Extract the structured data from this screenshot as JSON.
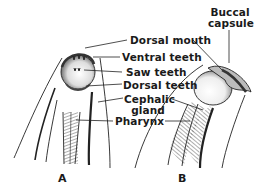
{
  "diagram": {
    "labels": {
      "dorsal_mouth": "Dorsal mouth",
      "ventral_teeth": "Ventral teeth",
      "saw_teeth": "Saw teeth",
      "dorsal_teeth": "Dorsal teeth",
      "cephalic_gland_1": "Cephalic",
      "cephalic_gland_2": "gland",
      "pharynx": "Pharynx",
      "buccal_capsule_1": "Buccal",
      "buccal_capsule_2": "capsule"
    },
    "panels": {
      "a": "A",
      "b": "B"
    },
    "colors": {
      "ink": "#1a1a1a",
      "background": "#ffffff"
    }
  }
}
